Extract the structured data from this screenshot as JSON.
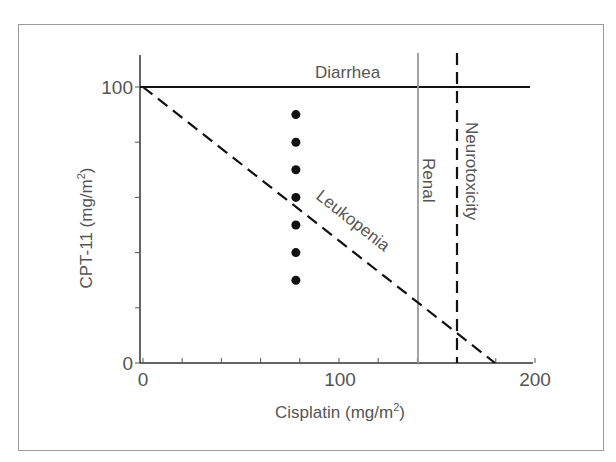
{
  "chart_data": {
    "type": "line",
    "title": "",
    "xlabel": "Cisplatin (mg/m2)",
    "ylabel": "CPT-11 (mg/m2)",
    "xlim": [
      0,
      200
    ],
    "ylim": [
      0,
      100
    ],
    "x_ticks": [
      0,
      20,
      40,
      60,
      80,
      100,
      120,
      140,
      160,
      180,
      200
    ],
    "x_tick_labels": [
      "0",
      "100",
      "200"
    ],
    "y_ticks": [
      0,
      20,
      40,
      60,
      80,
      100
    ],
    "y_tick_labels": [
      "0",
      "100"
    ],
    "grid": false,
    "legend": "none (inline labels)",
    "series": [
      {
        "name": "Diarrhea",
        "style": "solid",
        "color": "#111111",
        "x": [
          0,
          198
        ],
        "y": [
          100,
          100
        ]
      },
      {
        "name": "Leukopenia",
        "style": "dashed",
        "color": "#111111",
        "x": [
          0,
          180
        ],
        "y": [
          100,
          0
        ]
      },
      {
        "name": "Renal",
        "style": "solid-gray",
        "color": "#999999",
        "x": [
          140,
          140
        ],
        "y": [
          0,
          112
        ]
      },
      {
        "name": "Neurotoxicity",
        "style": "dashed",
        "color": "#111111",
        "x": [
          160,
          160
        ],
        "y": [
          0,
          112
        ]
      },
      {
        "name": "doses",
        "type": "scatter",
        "color": "#111111",
        "x": [
          78,
          78,
          78,
          78,
          78,
          78,
          78
        ],
        "y": [
          90,
          80,
          70,
          60,
          50,
          40,
          30
        ]
      }
    ]
  },
  "labels": {
    "x_axis_title": "Cisplatin (mg/m",
    "y_axis_title": "CPT-11 (mg/m",
    "superscript": "2",
    "close_paren": ")",
    "tick_x0": "0",
    "tick_x100": "100",
    "tick_x200": "200",
    "tick_y0": "0",
    "tick_y100": "100",
    "diarrhea": "Diarrhea",
    "leukopenia": "Leukopenia",
    "renal": "Renal",
    "neurotoxicity": "Neurotoxicity"
  }
}
